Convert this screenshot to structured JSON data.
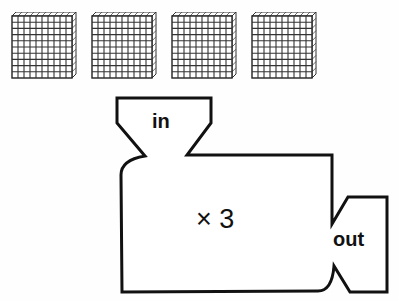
{
  "blocks": {
    "count": 4,
    "description": "hundred blocks (10x10 grids)",
    "grid_size": 10,
    "positions_x": [
      11,
      91,
      171,
      251
    ]
  },
  "machine": {
    "input_label": "in",
    "output_label": "out",
    "operation_symbol": "×",
    "operation_value": "3",
    "stroke_color": "#111111"
  }
}
